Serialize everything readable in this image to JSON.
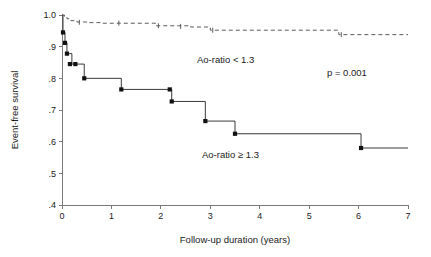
{
  "chart_data": {
    "type": "line",
    "subtype": "kaplan-meier-step",
    "title": "",
    "xlabel": "Follow-up duration (years)",
    "ylabel": "Event-free survival",
    "xlim": [
      0,
      7
    ],
    "ylim": [
      0.4,
      1.0
    ],
    "xticks": [
      0,
      1,
      2,
      3,
      4,
      5,
      6,
      7
    ],
    "xtick_labels": [
      "0",
      "1",
      "2",
      "3",
      "4",
      "5",
      "6",
      "7"
    ],
    "yticks": [
      0.4,
      0.5,
      0.6,
      0.7,
      0.8,
      0.9,
      1.0
    ],
    "ytick_labels": [
      ".4",
      ".5",
      ".6",
      ".7",
      ".8",
      ".9",
      "1.0"
    ],
    "grid": false,
    "legend_position": "inline-annotations",
    "series": [
      {
        "name": "Ao-ratio < 1.3",
        "style": "dashed",
        "color": "#5a5a5a",
        "markers": false,
        "x": [
          0.0,
          0.05,
          0.1,
          0.18,
          0.3,
          0.5,
          0.8,
          1.2,
          1.85,
          1.9,
          2.35,
          2.6,
          2.95,
          3.0,
          5.55,
          5.6,
          7.0
        ],
        "y": [
          1.0,
          0.995,
          0.988,
          0.982,
          0.978,
          0.976,
          0.974,
          0.974,
          0.974,
          0.966,
          0.966,
          0.962,
          0.962,
          0.952,
          0.952,
          0.938,
          0.938
        ],
        "censor_x": [
          0.35,
          1.15,
          1.95,
          2.4,
          3.05,
          5.65
        ],
        "censor_y": [
          0.977,
          0.974,
          0.966,
          0.964,
          0.952,
          0.938
        ]
      },
      {
        "name": "Ao-ratio ≥ 1.3",
        "style": "solid",
        "color": "#3a3a3a",
        "markers": true,
        "x": [
          0.0,
          0.02,
          0.06,
          0.1,
          0.16,
          0.2,
          0.27,
          0.45,
          1.2,
          2.18,
          2.22,
          2.9,
          3.5,
          6.05,
          7.0
        ],
        "y": [
          1.0,
          0.945,
          0.912,
          0.878,
          0.878,
          0.845,
          0.845,
          0.8,
          0.765,
          0.765,
          0.727,
          0.665,
          0.625,
          0.58,
          0.58
        ],
        "event_x": [
          0.02,
          0.06,
          0.1,
          0.16,
          0.27,
          0.45,
          1.2,
          2.18,
          2.22,
          2.9,
          3.5,
          6.05
        ],
        "event_y": [
          0.945,
          0.912,
          0.878,
          0.845,
          0.845,
          0.8,
          0.765,
          0.765,
          0.727,
          0.665,
          0.625,
          0.58
        ]
      }
    ],
    "annotations": [
      {
        "id": "upper-group-label",
        "text": "Ao-ratio < 1.3",
        "x": 2.35,
        "y": 0.885
      },
      {
        "id": "lower-group-label",
        "text": "Ao-ratio ≥ 1.3",
        "x": 2.55,
        "y": 0.585
      },
      {
        "id": "pvalue-label",
        "text": "p = 0.001",
        "x": 5.25,
        "y": 0.845
      }
    ]
  },
  "axes": {
    "x_title": "Follow-up duration (years)",
    "y_title": "Event-free survival"
  },
  "colors": {
    "background": "#ffffff",
    "axis": "#7a7a7a",
    "solid_curve": "#3a3a3a",
    "dashed_curve": "#5a5a5a",
    "marker": "#111111",
    "text": "#1a1a1a"
  }
}
